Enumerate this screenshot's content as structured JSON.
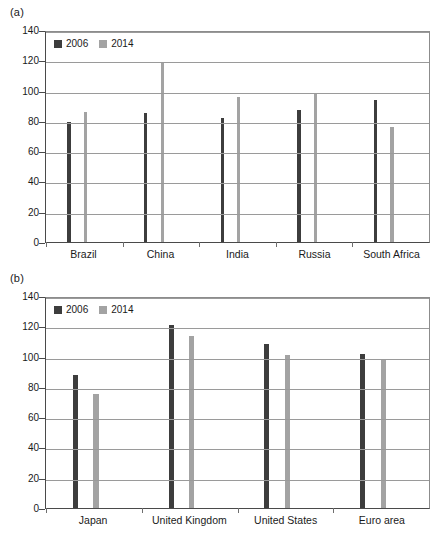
{
  "figure": {
    "panel_a_label": "(a)",
    "panel_b_label": "(b)"
  },
  "chart_data": [
    {
      "type": "bar",
      "panel": "(a)",
      "title": "",
      "xlabel": "",
      "ylabel": "",
      "ylim": [
        0,
        140
      ],
      "yticks": [
        0,
        20,
        40,
        60,
        80,
        100,
        120,
        140
      ],
      "grid": true,
      "legend_position": "top-left",
      "categories": [
        "Brazil",
        "China",
        "India",
        "Russia",
        "South Africa"
      ],
      "series": [
        {
          "name": "2006",
          "color": "#3d3d3d",
          "values": [
            79,
            85,
            82,
            87,
            94
          ]
        },
        {
          "name": "2014",
          "color": "#a3a3a3",
          "values": [
            86,
            119,
            95.5,
            98.5,
            76
          ]
        }
      ]
    },
    {
      "type": "bar",
      "panel": "(b)",
      "title": "",
      "xlabel": "",
      "ylabel": "",
      "ylim": [
        0,
        140
      ],
      "yticks": [
        0,
        20,
        40,
        60,
        80,
        100,
        120,
        140
      ],
      "grid": true,
      "legend_position": "top-left",
      "categories": [
        "Japan",
        "United Kingdom",
        "United States",
        "Euro area"
      ],
      "series": [
        {
          "name": "2006",
          "color": "#3d3d3d",
          "values": [
            88,
            121,
            108.5,
            102
          ]
        },
        {
          "name": "2014",
          "color": "#a3a3a3",
          "values": [
            75,
            113.5,
            101,
            97.5
          ]
        }
      ]
    }
  ]
}
